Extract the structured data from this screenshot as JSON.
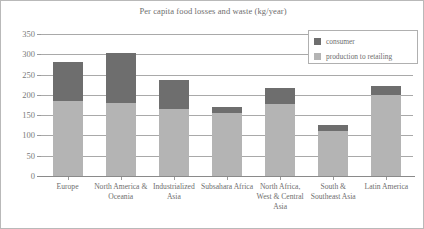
{
  "chart_data": {
    "type": "bar",
    "subtype": "stacked-bar",
    "title": "Per capita food losses and waste (kg/year)",
    "xlabel": "",
    "ylabel": "",
    "ylim": [
      0,
      350
    ],
    "yticks": [
      0,
      50,
      100,
      150,
      200,
      250,
      300,
      350
    ],
    "grid": true,
    "legend_position": "top-right",
    "categories": [
      "Europe",
      "North America & Oceania",
      "Industrialized Asia",
      "Subsahara Africa",
      "North Africa, West & Central Asia",
      "South & Southeast Asia",
      "Latin America"
    ],
    "series": [
      {
        "name": "production to retailing",
        "color": "#b4b4b4",
        "values": [
          185,
          180,
          165,
          156,
          178,
          111,
          199
        ]
      },
      {
        "name": "consumer",
        "color": "#6e6e6e",
        "values": [
          96,
          123,
          71,
          14,
          38,
          14,
          24
        ]
      }
    ],
    "totals": [
      281,
      303,
      236,
      170,
      216,
      125,
      223
    ]
  },
  "legend": {
    "items": [
      {
        "label": "consumer",
        "color": "#6e6e6e"
      },
      {
        "label": "production to retailing",
        "color": "#b4b4b4"
      }
    ]
  }
}
